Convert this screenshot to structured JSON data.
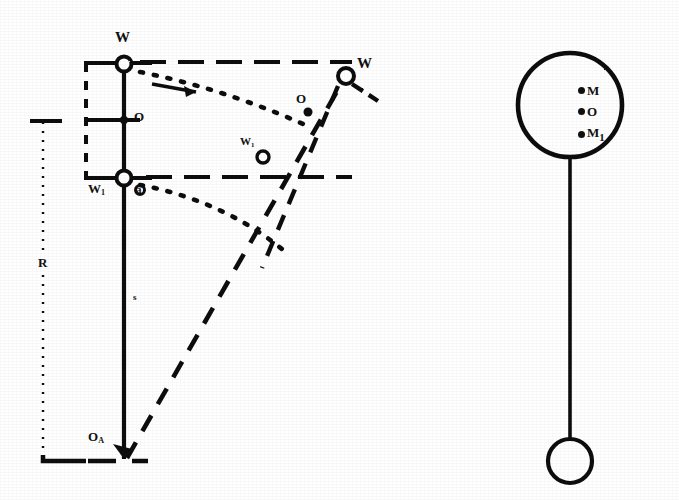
{
  "figure": {
    "background_color": "#ffffff",
    "ink_color": "#111111",
    "width": 679,
    "height": 500,
    "caption": ""
  },
  "left_diagram": {
    "name": "pendulum-swing-schematic",
    "labels": {
      "w_top": "W",
      "o_mid": "O",
      "w1_bottom": "W",
      "w1_bottom_sub": "1",
      "a_marker": "a",
      "w_prime": "W",
      "o_prime": "O",
      "w1_prime": "W",
      "w1_prime_sub": "1",
      "radius_r": "R",
      "length_s": "s",
      "pivot_o": "O",
      "pivot_o_sub": "A"
    }
  },
  "right_diagram": {
    "name": "pendulum-bob-schematic",
    "points": [
      {
        "label": "M",
        "sub": ""
      },
      {
        "label": "O",
        "sub": ""
      },
      {
        "label": "M",
        "sub": "1"
      }
    ]
  }
}
